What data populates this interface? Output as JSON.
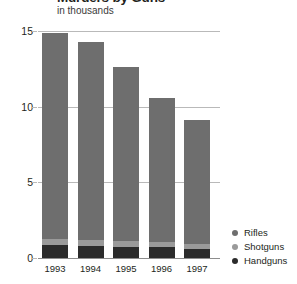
{
  "header": {
    "title": "Murders by Guns",
    "subtitle": "in thousands"
  },
  "legend": {
    "items": [
      {
        "label": "Rifles",
        "color": "#6e6e6e"
      },
      {
        "label": "Shotguns",
        "color": "#9a9a9a"
      },
      {
        "label": "Handguns",
        "color": "#2b2b2b"
      }
    ]
  },
  "chart_data": {
    "type": "bar",
    "subtype": "stacked-vertical",
    "title": "Murders by Guns",
    "subtitle": "in thousands",
    "xlabel": "",
    "ylabel": "in thousands",
    "ylim": [
      0,
      15
    ],
    "yticks": [
      0,
      5,
      10,
      15
    ],
    "ytick_labels": [
      "0",
      "5",
      "10",
      "15"
    ],
    "grid": true,
    "legend_position": "right-bottom",
    "categories": [
      "1993",
      "1994",
      "1995",
      "1996",
      "1997"
    ],
    "stack_order_bottom_to_top": [
      "Handguns",
      "Shotguns",
      "Rifles"
    ],
    "series": [
      {
        "name": "Handguns",
        "color": "#2b2b2b",
        "values": [
          0.85,
          0.8,
          0.75,
          0.7,
          0.6
        ]
      },
      {
        "name": "Shotguns",
        "color": "#9a9a9a",
        "values": [
          0.4,
          0.4,
          0.4,
          0.35,
          0.3
        ]
      },
      {
        "name": "Rifles",
        "color": "#6e6e6e",
        "values": [
          13.65,
          13.1,
          11.45,
          9.55,
          8.2
        ]
      }
    ],
    "totals": [
      14.9,
      14.3,
      12.6,
      10.6,
      9.1
    ]
  }
}
